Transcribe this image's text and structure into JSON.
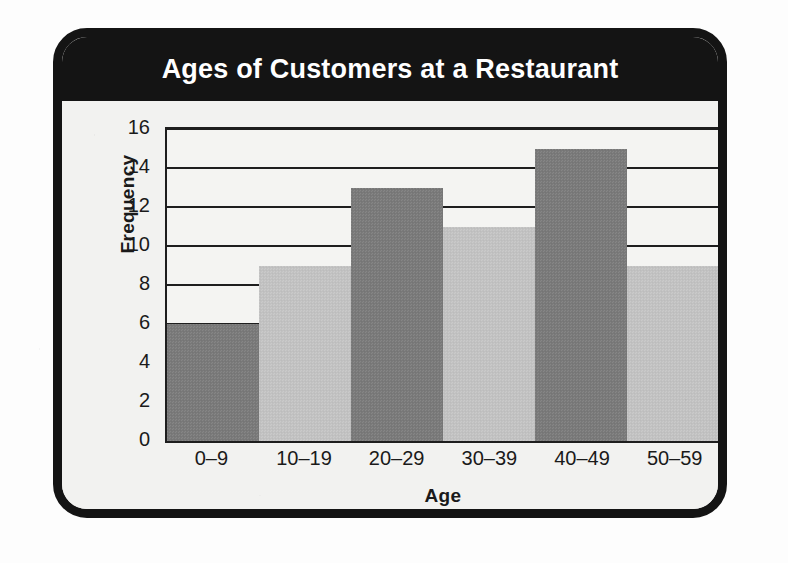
{
  "figure": {
    "title": "Ages of Customers at a Restaurant",
    "frame_color": "#141414",
    "title_band_color": "#141414",
    "title_text_color": "#ffffff",
    "background_color": "#f2f2f0"
  },
  "chart_data": {
    "type": "bar",
    "title": "Ages of Customers at a Restaurant",
    "xlabel": "Age",
    "ylabel": "Frequency",
    "categories": [
      "0–9",
      "10–19",
      "20–29",
      "30–39",
      "40–49",
      "50–59"
    ],
    "values": [
      6,
      9,
      13,
      11,
      15,
      9
    ],
    "bar_colors": [
      "#7b7b7b",
      "#c3c3c3",
      "#7b7b7b",
      "#c3c3c3",
      "#7b7b7b",
      "#c3c3c3"
    ],
    "ylim": [
      0,
      16
    ],
    "ytick_step": 2,
    "yticks": [
      16,
      14,
      12,
      10,
      8,
      6,
      4,
      2,
      0
    ],
    "gridlines": [
      16,
      14,
      12,
      10,
      8,
      6,
      4,
      2
    ],
    "grid": true,
    "grid_color": "#1e1e1e",
    "legend": null,
    "bar_gap": 0
  }
}
